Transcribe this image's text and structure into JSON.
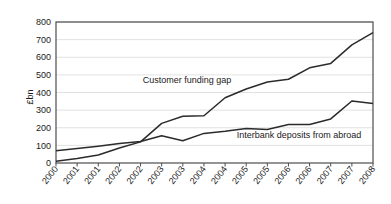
{
  "chart_data": {
    "type": "line",
    "title": "",
    "xlabel": "",
    "ylabel": "£bn",
    "ylim": [
      0,
      800
    ],
    "yticks": [
      0,
      100,
      200,
      300,
      400,
      500,
      600,
      700,
      800
    ],
    "grid": true,
    "legend_position": "inline-annotation",
    "categories": [
      "2000",
      "2001",
      "2001",
      "2002",
      "2002",
      "2003",
      "2003",
      "2004",
      "2004",
      "2005",
      "2005",
      "2006",
      "2006",
      "2007",
      "2007",
      "2008"
    ],
    "series": [
      {
        "name": "Customer funding gap",
        "values": [
          10,
          25,
          45,
          85,
          120,
          225,
          265,
          268,
          370,
          420,
          460,
          475,
          540,
          565,
          670,
          740
        ]
      },
      {
        "name": "Interbank deposits from abroad",
        "values": [
          70,
          82,
          95,
          110,
          122,
          155,
          126,
          168,
          180,
          196,
          190,
          218,
          218,
          250,
          352,
          338
        ]
      }
    ],
    "annotations": [
      {
        "text": "Customer funding gap",
        "x_index": 6.2,
        "value": 452
      },
      {
        "text": "Interbank deposits from abroad",
        "x_index": 11.5,
        "value": 140
      }
    ],
    "axis_color": "#4d4d4d",
    "grid_color": "#d9d9d9",
    "line_color": "#2b2b2b"
  }
}
